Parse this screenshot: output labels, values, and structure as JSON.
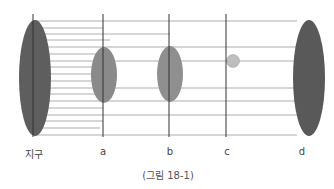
{
  "figure": {
    "caption": "(그림 18-1)",
    "labels": [
      {
        "id": "earth",
        "text": "지구",
        "x": 34
      },
      {
        "id": "a",
        "text": "a",
        "x": 103
      },
      {
        "id": "b",
        "text": "b",
        "x": 170
      },
      {
        "id": "c",
        "text": "c",
        "x": 227
      },
      {
        "id": "d",
        "text": "d",
        "x": 302
      }
    ],
    "colors": {
      "dark_ellipse": "#595959",
      "mid_ellipse": "#8a8a8a",
      "light_circle": "#b8b8b8",
      "lines": "#777777"
    }
  }
}
